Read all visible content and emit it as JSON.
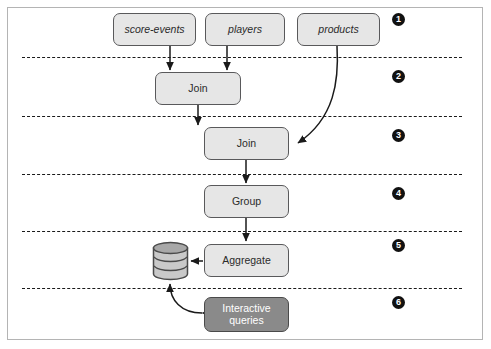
{
  "figure": {
    "border_color": "#b4b4b4",
    "background": "#ffffff"
  },
  "palette": {
    "node_fill": "#e6e6e6",
    "node_stroke": "#59595b",
    "query_fill": "#8a8a8a",
    "query_text": "#ffffff",
    "divider": "#1a1a1a",
    "badge_fill": "#111111",
    "arrow": "#1a1a1a"
  },
  "nodes": {
    "score_events": {
      "label": "score-events",
      "kind": "topic",
      "style": "italic"
    },
    "players": {
      "label": "players",
      "kind": "topic",
      "style": "italic"
    },
    "products": {
      "label": "products",
      "kind": "topic",
      "style": "italic"
    },
    "join1": {
      "label": "Join",
      "kind": "operator"
    },
    "join2": {
      "label": "Join",
      "kind": "operator"
    },
    "group": {
      "label": "Group",
      "kind": "operator"
    },
    "aggregate": {
      "label": "Aggregate",
      "kind": "operator"
    },
    "interactive_queries": {
      "label": "Interactive\nqueries",
      "line1": "Interactive",
      "line2": "queries",
      "kind": "query"
    },
    "state_store": {
      "icon": "database-cylinder-icon",
      "kind": "store"
    }
  },
  "stages": [
    {
      "number": "1",
      "badge": "❶"
    },
    {
      "number": "2",
      "badge": "❷"
    },
    {
      "number": "3",
      "badge": "❸"
    },
    {
      "number": "4",
      "badge": "❹"
    },
    {
      "number": "5",
      "badge": "❺"
    },
    {
      "number": "6",
      "badge": "❻"
    }
  ],
  "badge_labels": [
    "1",
    "2",
    "3",
    "4",
    "5",
    "6"
  ],
  "edges": [
    {
      "from": "score-events",
      "to": "join1",
      "shape": "straight"
    },
    {
      "from": "players",
      "to": "join1",
      "shape": "straight"
    },
    {
      "from": "join1",
      "to": "join2",
      "shape": "straight"
    },
    {
      "from": "products",
      "to": "join2",
      "shape": "curved"
    },
    {
      "from": "join2",
      "to": "group",
      "shape": "straight"
    },
    {
      "from": "group",
      "to": "aggregate",
      "shape": "straight"
    },
    {
      "from": "aggregate",
      "to": "state-store",
      "shape": "straight"
    },
    {
      "from": "interactive-queries",
      "to": "state-store",
      "shape": "curved-bidirectional"
    }
  ]
}
